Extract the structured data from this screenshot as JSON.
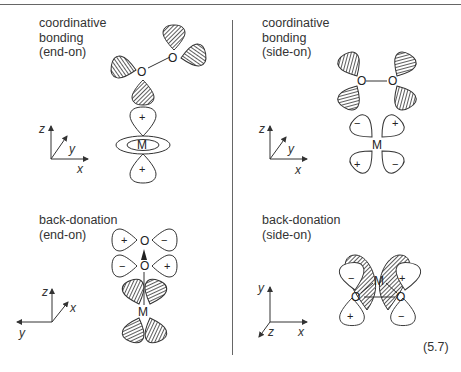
{
  "panels": {
    "top_left": {
      "title_lines": "coordinative\nbonding\n(end-on)",
      "axes": {
        "vertical": "z",
        "diagonal": "y",
        "horizontal": "x"
      },
      "atoms": {
        "o1": "O",
        "o2": "O",
        "metal": "M"
      },
      "lobe_signs": {
        "o2_top": "+",
        "o2_right": "−",
        "o1_left": "−",
        "o1_bottom": "+",
        "m_top": "+",
        "m_bottom": "+"
      }
    },
    "top_right": {
      "title_lines": "coordinative\nbonding\n(side-on)",
      "axes": {
        "vertical": "z",
        "diagonal": "y",
        "horizontal": "x"
      },
      "atoms": {
        "o1": "O",
        "o2": "O",
        "metal": "M"
      },
      "lobe_signs": {
        "m_ul": "−",
        "m_ur": "+",
        "m_ll": "+",
        "m_lr": "−"
      }
    },
    "bottom_left": {
      "title_lines": "back-donation\n(end-on)",
      "axes": {
        "vertical": "z",
        "diagonal": "x",
        "horizontal": "y"
      },
      "atoms": {
        "o1": "O",
        "o2": "O",
        "metal": "M"
      },
      "lobe_signs": {
        "o_top_left": "+",
        "o_top_right": "−",
        "o_mid_left": "−",
        "o_mid_right": "+",
        "m_ul": "−",
        "m_ur": "+",
        "m_ll": "+",
        "m_lr": "−"
      }
    },
    "bottom_right": {
      "title_lines": "back-donation\n(side-on)",
      "axes": {
        "vertical": "y",
        "diagonal": "z",
        "horizontal": "x"
      },
      "atoms": {
        "o1": "O",
        "o2": "O",
        "metal": "M"
      },
      "lobe_signs": {
        "ul": "−",
        "ur": "+",
        "ll": "+",
        "lr": "−"
      }
    }
  },
  "equation_number": "(5.7)"
}
